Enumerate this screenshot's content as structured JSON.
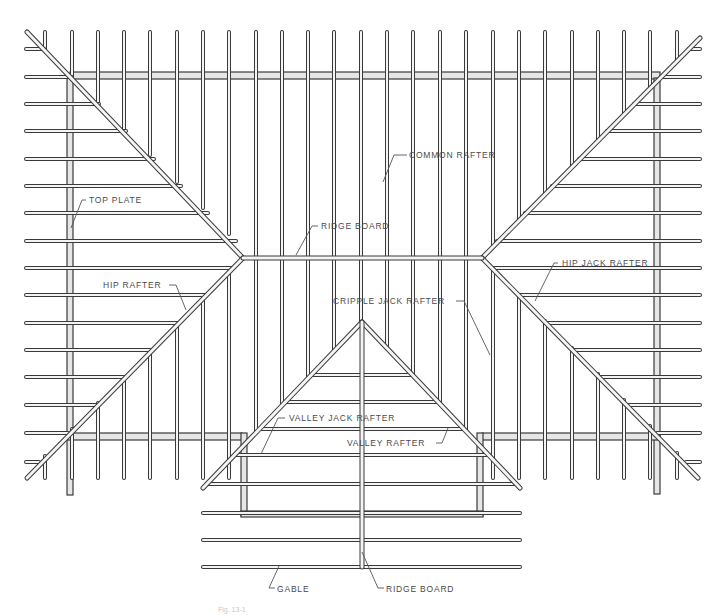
{
  "figure": {
    "caption": "Fig. 13-1.",
    "colors": {
      "line": "#3a3a3a",
      "fill": "#f4f4f4",
      "plate_fill": "#e6e6e6",
      "label": "#4a4a4a"
    }
  },
  "labels": {
    "common_rafter": "COMMON RAFTER",
    "top_plate": "TOP PLATE",
    "ridge_board_main": "RIDGE BOARD",
    "hip_rafter": "HIP RAFTER",
    "hip_jack_rafter": "HIP JACK RAFTER",
    "cripple_jack_rafter": "CRIPPLE JACK RAFTER",
    "valley_jack_rafter": "VALLEY JACK RAFTER",
    "valley_rafter": "VALLEY RAFTER",
    "gable": "GABLE",
    "ridge_board_gable": "RIDGE BOARD"
  },
  "geometry": {
    "common_rafter_x": [
      45,
      72,
      98,
      124,
      150,
      177,
      203,
      229,
      256,
      282,
      308,
      334,
      361,
      387,
      413,
      440,
      466,
      493,
      519,
      545,
      572,
      598,
      624,
      650,
      677
    ],
    "side_rafter_y": [
      49,
      77,
      104,
      131,
      159,
      186,
      213,
      241,
      268,
      295,
      323,
      350,
      377,
      405,
      433,
      462
    ],
    "ridge": {
      "y": 258,
      "x1": 243,
      "x2": 482
    },
    "gable_peak": {
      "x": 362,
      "y": 322
    },
    "gable_ridge_bottom_y": 567,
    "gable_rafter_y": [
      375,
      402,
      429,
      455,
      484,
      513,
      540,
      567
    ]
  }
}
